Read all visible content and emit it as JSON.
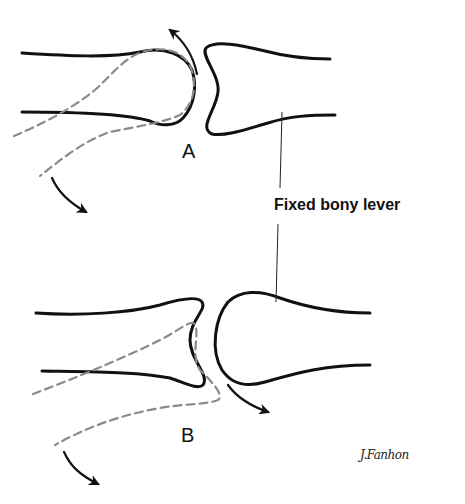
{
  "figure": {
    "panels": [
      {
        "id": "A",
        "label": "A",
        "description": "Convex head of moving bone rolling on concave fixed bone; distal end swings downward"
      },
      {
        "id": "B",
        "label": "B",
        "description": "Concave base of moving bone gliding on convex head of fixed bone; both move in same direction"
      }
    ],
    "callout": {
      "text": "Fixed bony lever"
    },
    "signature": {
      "text": "J.Fanhon"
    },
    "colors": {
      "line": "#111111",
      "dashed": "#8a8a8a",
      "background": "#ffffff"
    }
  }
}
